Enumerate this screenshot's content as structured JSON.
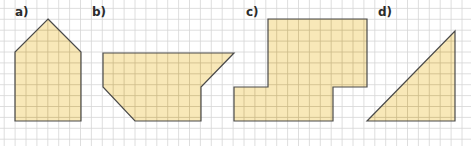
{
  "figure": {
    "width": 471,
    "height": 146,
    "grid": {
      "origin_x": 4.2,
      "origin_y": 8.4,
      "cell": 10.9,
      "cols": 42,
      "rows": 12,
      "line_color": "#d6d6d6",
      "inner_line_color": "#cdbb8a"
    },
    "colors": {
      "fill": "#f8e8b8",
      "stroke": "#4a4a4a",
      "label": "#2b2b2b"
    },
    "shapes": [
      {
        "id": "a",
        "label": "a)",
        "label_pos": [
          15,
          6
        ],
        "points": [
          [
            48,
            19
          ],
          [
            81,
            52
          ],
          [
            81,
            121
          ],
          [
            15,
            121
          ],
          [
            15,
            52
          ]
        ]
      },
      {
        "id": "b",
        "label": "b)",
        "label_pos": [
          92,
          6
        ],
        "points": [
          [
            103,
            53
          ],
          [
            234,
            53
          ],
          [
            201,
            87
          ],
          [
            201,
            121
          ],
          [
            135,
            121
          ],
          [
            103,
            87
          ]
        ]
      },
      {
        "id": "c",
        "label": "c)",
        "label_pos": [
          246,
          6
        ],
        "points": [
          [
            268,
            19
          ],
          [
            367,
            19
          ],
          [
            367,
            87
          ],
          [
            333,
            87
          ],
          [
            333,
            121
          ],
          [
            234,
            121
          ],
          [
            234,
            87
          ],
          [
            268,
            87
          ]
        ]
      },
      {
        "id": "d",
        "label": "d)",
        "label_pos": [
          378,
          6
        ],
        "points": [
          [
            367,
            121
          ],
          [
            455,
            31
          ],
          [
            455,
            121
          ]
        ]
      }
    ]
  }
}
